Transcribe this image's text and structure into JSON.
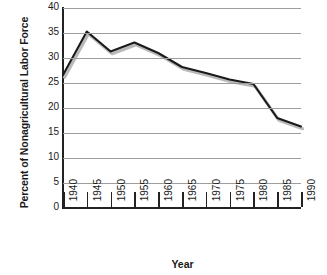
{
  "chart_data": {
    "type": "line",
    "title": "",
    "xlabel": "Year",
    "ylabel": "Percent of Nonagricultural Labor Force",
    "x": [
      1940,
      1945,
      1950,
      1955,
      1960,
      1965,
      1970,
      1975,
      1980,
      1985,
      1990
    ],
    "xtick_labels": [
      "1940",
      "1945",
      "1950",
      "1955",
      "1960",
      "1965",
      "1970",
      "1975",
      "1980",
      "1985",
      "1990"
    ],
    "xlim": [
      1940,
      1990
    ],
    "ytick_labels": [
      "0",
      "5",
      "10",
      "15",
      "20",
      "25",
      "30",
      "35",
      "40"
    ],
    "yticks": [
      0,
      5,
      10,
      15,
      20,
      25,
      30,
      35,
      40
    ],
    "ylim": [
      0,
      40
    ],
    "grid": "horizontal",
    "legend": "none",
    "series": [
      {
        "name": "Percent of Nonagricultural Labor Force",
        "values": [
          26.6,
          35.3,
          31.3,
          33.1,
          31.0,
          28.2,
          27.0,
          25.7,
          24.8,
          18.0,
          16.3
        ],
        "color": "#1a1a1a",
        "shadow_color": "#b9b9b9"
      }
    ]
  },
  "figure": {
    "background_color": "#ffffff",
    "axis_color": "#222222",
    "gridline_color": "#9d9d9d"
  }
}
